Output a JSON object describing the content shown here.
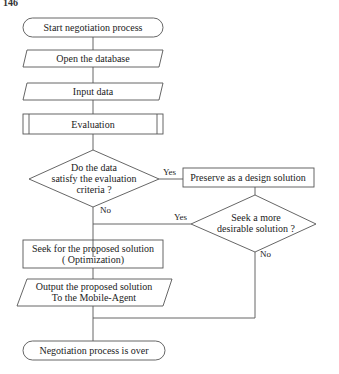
{
  "page_number": "146",
  "nodes": {
    "start": "Start negotiation process",
    "open_db": "Open the database",
    "input": "Input data",
    "evaluation": "Evaluation",
    "decision1": [
      "Do the data",
      "satisfy the evaluation",
      "criteria ?"
    ],
    "preserve": "Preserve as a design solution",
    "decision2": [
      "Seek a more",
      "desirable solution ?"
    ],
    "seek": [
      "Seek for the proposed solution",
      "( Optimization)"
    ],
    "output": [
      "Output the proposed solution",
      "To the Mobile-Agent"
    ],
    "end": "Negotiation process is over"
  },
  "edges": {
    "d1_yes": "Yes",
    "d1_no": "No",
    "d2_yes": "Yes",
    "d2_no": "No"
  }
}
